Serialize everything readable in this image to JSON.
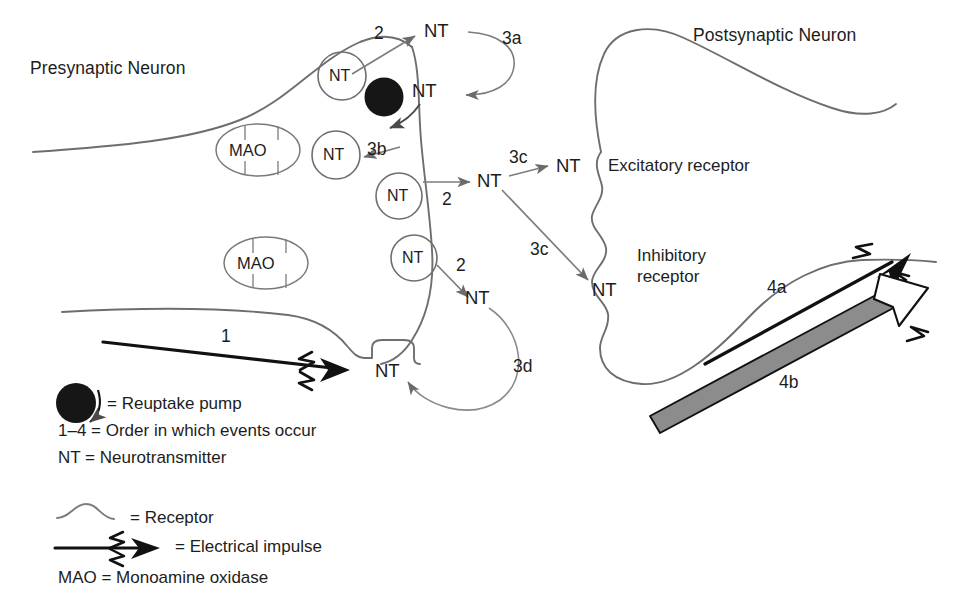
{
  "figure": {
    "background_color": "#ffffff",
    "line_color": "#595959",
    "text_color": "#1d1d1d",
    "accent_black": "#111111"
  },
  "cells": {
    "presynaptic_label": "Presynaptic Neuron",
    "postsynaptic_label": "Postsynaptic Neuron"
  },
  "receptors": {
    "excitatory": "Excitatory receptor",
    "inhibitory_line1": "Inhibitory",
    "inhibitory_line2": "receptor"
  },
  "organelles": {
    "mao_1": "MAO",
    "mao_2": "MAO",
    "vesicle_1": "NT",
    "vesicle_2": "NT",
    "vesicle_3": "NT",
    "vesicle_4": "NT"
  },
  "nt_labels": {
    "released_top": "NT",
    "reuptake_returning": "NT",
    "cleft_mid": "NT",
    "cleft_lower": "NT",
    "excitatory_bound": "NT",
    "inhibitory_bound": "NT",
    "terminal_notch": "NT"
  },
  "steps": {
    "impulse": "1",
    "release_top": "2",
    "release_mid": "2",
    "release_low": "2",
    "reuptake": "3a",
    "mao_degradation": "3b",
    "receptor_binding_excitatory": "3c",
    "receptor_binding_inhibitory": "3c",
    "autoreceptor_feedback": "3d",
    "postsynaptic_impulse_a": "4a",
    "postsynaptic_impulse_b": "4b"
  },
  "legend": {
    "reuptake_pump": "= Reuptake pump",
    "order": "1–4 = Order in which events occur",
    "nt": "NT = Neurotransmitter",
    "receptor": "= Receptor",
    "impulse": "= Electrical impulse",
    "mao": "MAO = Monoamine oxidase"
  }
}
